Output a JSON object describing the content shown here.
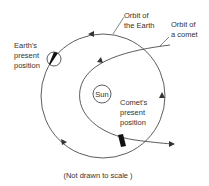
{
  "labels": {
    "orbit_earth_1": "Orbit of",
    "orbit_earth_2": "the Earth",
    "orbit_comet_1": "Orbit of",
    "orbit_comet_2": "a comet",
    "earth_1": "Earth's",
    "earth_2": "present",
    "earth_3": "position",
    "sun": "Sun",
    "comet_1": "Comet's",
    "comet_2": "present",
    "comet_3": "position",
    "caption": "(Not drawn to scale )"
  },
  "colors": {
    "line": "#333333",
    "fill_dark": "#111111"
  }
}
